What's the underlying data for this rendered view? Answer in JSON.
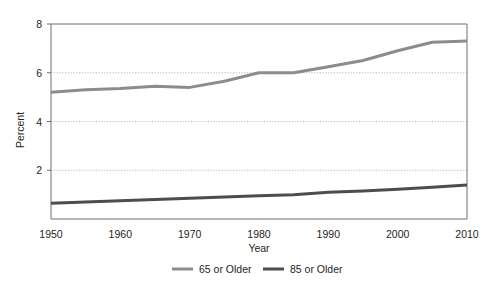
{
  "chart_data": {
    "type": "line",
    "title": "",
    "xlabel": "Year",
    "ylabel": "Percent",
    "xlim": [
      1950,
      2010
    ],
    "ylim": [
      0,
      8
    ],
    "grid": true,
    "grid_axis": "y",
    "legend_position": "bottom-center",
    "xticks": [
      "1950",
      "1960",
      "1970",
      "1980",
      "1990",
      "2000",
      "2010"
    ],
    "xtick_values": [
      1950,
      1960,
      1970,
      1980,
      1990,
      2000,
      2010
    ],
    "yticks": [
      "2",
      "4",
      "6",
      "8"
    ],
    "ytick_values": [
      2,
      4,
      6,
      8
    ],
    "x": [
      1950,
      1955,
      1960,
      1965,
      1970,
      1975,
      1980,
      1985,
      1990,
      1995,
      2000,
      2005,
      2010
    ],
    "series": [
      {
        "name": "65 or Older",
        "color": "#8c8c8c",
        "width": 3.0,
        "values": [
          5.2,
          5.3,
          5.35,
          5.45,
          5.4,
          5.65,
          6.0,
          6.0,
          6.25,
          6.5,
          6.9,
          7.25,
          7.3
        ]
      },
      {
        "name": "85 or Older",
        "color": "#4d4d4d",
        "width": 3.0,
        "values": [
          0.65,
          0.7,
          0.75,
          0.8,
          0.85,
          0.9,
          0.95,
          1.0,
          1.1,
          1.15,
          1.22,
          1.3,
          1.4
        ]
      }
    ]
  },
  "colors": {
    "series_65_plus": "#8c8c8c",
    "series_85_plus": "#4d4d4d",
    "axis": "#6e6e6e",
    "gridline": "#b9b9b9",
    "text": "#231f20",
    "background": "#ffffff"
  },
  "axes": {
    "y_title": "Percent",
    "x_title": "Year",
    "y_tick_0": "2",
    "y_tick_1": "4",
    "y_tick_2": "6",
    "y_tick_3": "8",
    "x_tick_0": "1950",
    "x_tick_1": "1960",
    "x_tick_2": "1970",
    "x_tick_3": "1980",
    "x_tick_4": "1990",
    "x_tick_5": "2000",
    "x_tick_6": "2010"
  },
  "legend": {
    "entries": [
      {
        "label": "65 or Older"
      },
      {
        "label": "85 or Older"
      }
    ],
    "entry_0_label": "65 or Older",
    "entry_1_label": "85 or Older"
  }
}
